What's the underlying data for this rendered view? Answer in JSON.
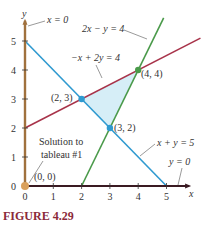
{
  "figure": {
    "caption": "FIGURE 4.29",
    "colors": {
      "x_eq_0": "#a0713d",
      "y_eq_0": "#3a1a22",
      "x_plus_y_5": "#2f9ad0",
      "neg_x_plus_2y_4": "#a8334a",
      "two_x_minus_y_4": "#4a9a4a",
      "feasible_region": "#d6eef7",
      "origin_point": "#d9a05c"
    }
  },
  "chart_data": {
    "type": "line",
    "title": "",
    "xlabel": "x",
    "ylabel": "y",
    "xlim": [
      0,
      5.8
    ],
    "ylim": [
      0,
      5.7
    ],
    "x_ticks": [
      "0",
      "1",
      "2",
      "3",
      "4",
      "5"
    ],
    "y_ticks": [
      "0",
      "1",
      "2",
      "3",
      "4",
      "5"
    ],
    "lines": [
      {
        "name": "x = 0",
        "label": "x = 0"
      },
      {
        "name": "y = 0",
        "label": "y = 0"
      },
      {
        "name": "x + y = 5",
        "label": "x + y = 5",
        "points": [
          [
            0,
            5
          ],
          [
            5,
            0
          ]
        ]
      },
      {
        "name": "-x + 2y = 4",
        "label": "−x + 2y = 4",
        "points": [
          [
            0,
            2
          ],
          [
            6.2,
            5.1
          ]
        ]
      },
      {
        "name": "2x - y = 4",
        "label": "2x − y = 4",
        "points": [
          [
            2,
            0
          ],
          [
            4.9,
            5.8
          ]
        ]
      }
    ],
    "feasible_region": [
      [
        2,
        3
      ],
      [
        4,
        4
      ],
      [
        3,
        2
      ]
    ],
    "points": [
      {
        "x": 2,
        "y": 3,
        "label": "(2, 3)"
      },
      {
        "x": 4,
        "y": 4,
        "label": "(4, 4)"
      },
      {
        "x": 3,
        "y": 2,
        "label": "(3, 2)"
      },
      {
        "x": 0,
        "y": 0,
        "label": "(0, 0)"
      }
    ],
    "annotations": [
      "Solution to",
      "tableau #1"
    ]
  }
}
